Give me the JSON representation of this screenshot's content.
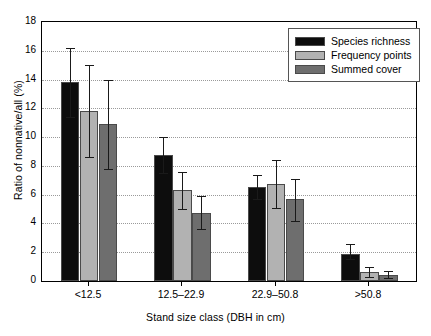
{
  "chart_data": {
    "type": "bar",
    "title": "",
    "xlabel": "Stand size class (DBH in cm)",
    "ylabel": "Ratio of nonnative/all (%)",
    "categories": [
      "<12.5",
      "12.5–22.9",
      "22.9–50.8",
      ">50.8"
    ],
    "ylim": [
      0,
      18
    ],
    "yticks": [
      0,
      2,
      4,
      6,
      8,
      10,
      12,
      14,
      16,
      18
    ],
    "ytick_labels": [
      "0",
      "2",
      "4",
      "6",
      "8",
      "10",
      "12",
      "14",
      "16",
      "18"
    ],
    "grid": true,
    "grid_axis": "y",
    "legend_position": "top-right",
    "series": [
      {
        "name": "Species richness",
        "color": "#0d0d0d",
        "values": [
          13.8,
          8.75,
          6.5,
          1.9
        ],
        "err_low": [
          11.4,
          7.5,
          5.7,
          1.5
        ],
        "err_high": [
          16.2,
          10.0,
          7.4,
          2.55
        ]
      },
      {
        "name": "Frequency points",
        "color": "#b2b2b2",
        "values": [
          11.8,
          6.3,
          6.75,
          0.65
        ],
        "err_low": [
          8.6,
          5.0,
          5.1,
          0.3
        ],
        "err_high": [
          15.0,
          7.6,
          8.4,
          1.0
        ]
      },
      {
        "name": "Summed cover",
        "color": "#6e6e6e",
        "values": [
          10.9,
          4.75,
          5.7,
          0.4
        ],
        "err_low": [
          7.8,
          3.6,
          4.2,
          0.2
        ],
        "err_high": [
          14.0,
          5.9,
          7.1,
          0.7
        ]
      }
    ]
  },
  "axes": {
    "y_title": "Ratio of nonnative/all (%)",
    "x_title": "Stand size class (DBH in cm)"
  },
  "legend": {
    "entries": [
      {
        "label": "Species richness",
        "color": "#0d0d0d"
      },
      {
        "label": "Frequency points",
        "color": "#b2b2b2"
      },
      {
        "label": "Summed cover",
        "color": "#6e6e6e"
      }
    ]
  }
}
